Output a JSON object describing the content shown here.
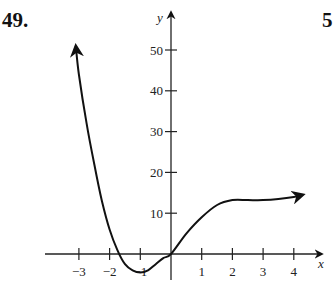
{
  "problem_number": "49.",
  "next_problem_fragment": "5",
  "chart_data": {
    "type": "line",
    "title": "",
    "xlabel": "x",
    "ylabel": "y",
    "x_ticks": [
      -3,
      -2,
      -1,
      1,
      2,
      3,
      4
    ],
    "x_tick_labels": [
      "−3",
      "−2",
      "−1",
      "1",
      "2",
      "3",
      "4"
    ],
    "y_ticks": [
      10,
      20,
      30,
      40,
      50
    ],
    "y_tick_labels": [
      "10",
      "20",
      "30",
      "40",
      "50"
    ],
    "xlim": [
      -3.5,
      4.9
    ],
    "ylim": [
      -5,
      55
    ],
    "grid": false,
    "series": [
      {
        "name": "f(x)",
        "x": [
          -3.1,
          -3.0,
          -2.75,
          -2.5,
          -2.25,
          -2.0,
          -1.75,
          -1.5,
          -1.25,
          -1.0,
          -0.75,
          -0.5,
          -0.25,
          0,
          0.5,
          1.0,
          1.5,
          2.0,
          2.5,
          3.0,
          3.5,
          4.0,
          4.3
        ],
        "y": [
          51,
          44,
          32,
          22,
          13,
          6,
          1,
          -2.5,
          -4,
          -4.5,
          -4,
          -2.5,
          -1,
          0,
          5,
          9,
          12,
          13.2,
          13.2,
          13.2,
          13.5,
          14,
          14.5
        ],
        "arrows": [
          "left-end-up",
          "right-end"
        ]
      }
    ]
  }
}
